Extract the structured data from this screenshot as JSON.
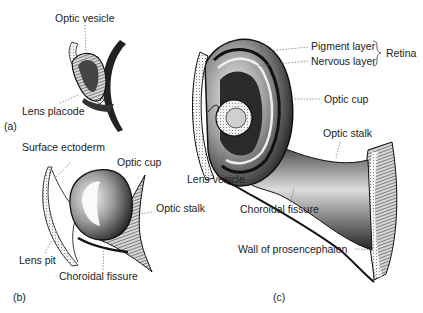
{
  "figure": {
    "panels": [
      {
        "id": "a",
        "label": "(a)",
        "labels": [
          "Optic vesicle",
          "Lens placode"
        ]
      },
      {
        "id": "b",
        "label": "(b)",
        "labels": [
          "Surface ectoderm",
          "Optic cup",
          "Optic stalk",
          "Lens pit",
          "Choroidal fissure"
        ]
      },
      {
        "id": "c",
        "label": "(c)",
        "labels": [
          "Pigment layer",
          "Nervous layer",
          "Retina",
          "Optic cup",
          "Optic stalk",
          "Lens vesicle",
          "Choroidal fissure",
          "Wall of prosencephalon"
        ]
      }
    ]
  },
  "a": {
    "panel_label": "(a)",
    "optic_vesicle": "Optic vesicle",
    "lens_placode": "Lens placode"
  },
  "b": {
    "panel_label": "(b)",
    "surface_ectoderm": "Surface ectoderm",
    "optic_cup": "Optic cup",
    "optic_stalk": "Optic stalk",
    "lens_pit": "Lens pit",
    "choroidal_fissure": "Choroidal fissure"
  },
  "c": {
    "panel_label": "(c)",
    "pigment_layer": "Pigment layer",
    "nervous_layer": "Nervous layer",
    "retina": "Retina",
    "optic_cup": "Optic cup",
    "optic_stalk": "Optic stalk",
    "lens_vesicle": "Lens vesicle",
    "choroidal_fissure": "Choroidal fissure",
    "wall": "Wall of prosencephalon"
  }
}
